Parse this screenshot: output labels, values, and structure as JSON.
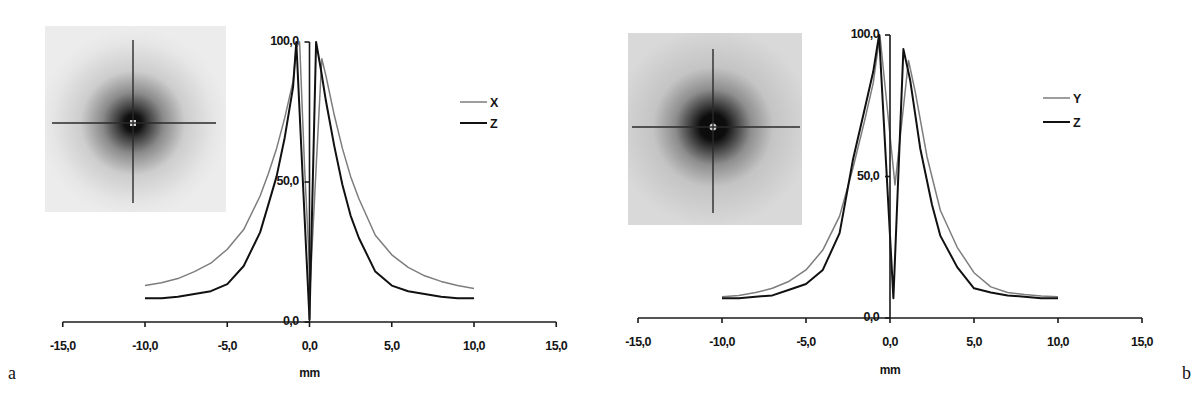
{
  "figure": {
    "panel_labels": {
      "a": "a",
      "b": "b"
    }
  },
  "chart_data": [
    {
      "panel": "a",
      "type": "line",
      "title": "",
      "xlabel": "mm",
      "ylabel": "",
      "xlim": [
        -15,
        15
      ],
      "ylim": [
        0,
        100
      ],
      "grid": false,
      "legend_position": "upper right",
      "x_ticks": [
        -15,
        -10,
        -5,
        0,
        5,
        10,
        15
      ],
      "x_tick_labels": [
        "-15,0",
        "-10,0",
        "-5,0",
        "0,0",
        "5,0",
        "10,0",
        "15,0"
      ],
      "y_ticks": [
        0,
        50,
        100
      ],
      "y_tick_labels": [
        "0,0",
        "50,0",
        "100,0"
      ],
      "inset_image": "point-spread-crosshair-image",
      "series": [
        {
          "name": "X",
          "color": "#7d7d7d",
          "points": [
            [
              -10,
              13
            ],
            [
              -9,
              14
            ],
            [
              -8,
              15.5
            ],
            [
              -7,
              18
            ],
            [
              -6,
              21
            ],
            [
              -5,
              26
            ],
            [
              -4,
              33
            ],
            [
              -3,
              45
            ],
            [
              -2.5,
              53
            ],
            [
              -2,
              62
            ],
            [
              -1.5,
              73
            ],
            [
              -1,
              86
            ],
            [
              -0.8,
              98
            ],
            [
              -0.6,
              100
            ],
            [
              -0.3,
              55
            ],
            [
              0.05,
              14
            ],
            [
              0.4,
              55
            ],
            [
              0.75,
              94
            ],
            [
              1,
              88
            ],
            [
              1.5,
              74
            ],
            [
              2,
              62
            ],
            [
              2.5,
              52
            ],
            [
              3,
              44
            ],
            [
              4,
              31
            ],
            [
              5,
              24
            ],
            [
              6,
              19.5
            ],
            [
              7,
              16.5
            ],
            [
              8,
              14.5
            ],
            [
              9,
              13
            ],
            [
              10,
              12
            ]
          ]
        },
        {
          "name": "Z",
          "color": "#111111",
          "points": [
            [
              -10,
              8.5
            ],
            [
              -9,
              8.5
            ],
            [
              -8,
              9
            ],
            [
              -7,
              10
            ],
            [
              -6,
              11
            ],
            [
              -5,
              13.5
            ],
            [
              -4,
              20
            ],
            [
              -3,
              32
            ],
            [
              -2.5,
              42
            ],
            [
              -2,
              52
            ],
            [
              -1.5,
              66
            ],
            [
              -1,
              84
            ],
            [
              -0.8,
              100
            ],
            [
              -0.4,
              50
            ],
            [
              0,
              1
            ],
            [
              0.4,
              100
            ],
            [
              0.7,
              90
            ],
            [
              1,
              79
            ],
            [
              1.5,
              63
            ],
            [
              2,
              49
            ],
            [
              2.5,
              38
            ],
            [
              3,
              30
            ],
            [
              4,
              18
            ],
            [
              5,
              13
            ],
            [
              6,
              11
            ],
            [
              7,
              10
            ],
            [
              8,
              9
            ],
            [
              9,
              8.5
            ],
            [
              10,
              8.5
            ]
          ]
        }
      ]
    },
    {
      "panel": "b",
      "type": "line",
      "title": "",
      "xlabel": "mm",
      "ylabel": "",
      "xlim": [
        -15,
        15
      ],
      "ylim": [
        0,
        100
      ],
      "grid": false,
      "legend_position": "upper right",
      "x_ticks": [
        -15,
        -10,
        -5,
        0,
        5,
        10,
        15
      ],
      "x_tick_labels": [
        "-15,0",
        "-10,0",
        "-5,0",
        "0,0",
        "5,0",
        "10,0",
        "15,0"
      ],
      "y_ticks": [
        0,
        50,
        100
      ],
      "y_tick_labels": [
        "0,0",
        "50,0",
        "100,0"
      ],
      "inset_image": "point-spread-crosshair-image",
      "series": [
        {
          "name": "Y",
          "color": "#7d7d7d",
          "points": [
            [
              -10,
              7.5
            ],
            [
              -9,
              8
            ],
            [
              -8,
              9
            ],
            [
              -7,
              10.5
            ],
            [
              -6,
              13
            ],
            [
              -5,
              17
            ],
            [
              -4,
              24
            ],
            [
              -3,
              36
            ],
            [
              -2.2,
              53
            ],
            [
              -1.5,
              70
            ],
            [
              -1,
              83
            ],
            [
              -0.6,
              100
            ],
            [
              0.3,
              47
            ],
            [
              1.1,
              91
            ],
            [
              1.5,
              80
            ],
            [
              2.2,
              57
            ],
            [
              3,
              38
            ],
            [
              4,
              25
            ],
            [
              5,
              16
            ],
            [
              6,
              11
            ],
            [
              7,
              9
            ],
            [
              8,
              8.3
            ],
            [
              9,
              7.8
            ],
            [
              10,
              7.5
            ]
          ]
        },
        {
          "name": "Z",
          "color": "#111111",
          "points": [
            [
              -10,
              7
            ],
            [
              -9,
              7
            ],
            [
              -8,
              7.5
            ],
            [
              -7,
              8
            ],
            [
              -6,
              10
            ],
            [
              -5,
              12
            ],
            [
              -4,
              17
            ],
            [
              -3,
              30
            ],
            [
              -2.2,
              56
            ],
            [
              -1.5,
              74
            ],
            [
              -1,
              87
            ],
            [
              -0.65,
              100
            ],
            [
              0.2,
              7
            ],
            [
              0.8,
              95
            ],
            [
              1.2,
              84
            ],
            [
              1.8,
              60
            ],
            [
              2.5,
              40
            ],
            [
              3,
              29
            ],
            [
              4,
              18
            ],
            [
              5,
              10.5
            ],
            [
              6,
              9
            ],
            [
              7,
              8
            ],
            [
              8,
              7.5
            ],
            [
              9,
              7
            ],
            [
              10,
              7
            ]
          ]
        }
      ]
    }
  ]
}
